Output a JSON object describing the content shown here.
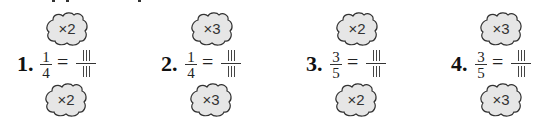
{
  "exercise": {
    "problems": [
      {
        "number": "1.",
        "numerator": "1",
        "denominator": "4",
        "equals": "=",
        "top_multiplier": "×2",
        "bottom_multiplier": "×2",
        "answer_numerator": "",
        "answer_denominator": ""
      },
      {
        "number": "2.",
        "numerator": "1",
        "denominator": "4",
        "equals": "=",
        "top_multiplier": "×3",
        "bottom_multiplier": "×3",
        "answer_numerator": "",
        "answer_denominator": ""
      },
      {
        "number": "3.",
        "numerator": "3",
        "denominator": "5",
        "equals": "=",
        "top_multiplier": "×2",
        "bottom_multiplier": "×2",
        "answer_numerator": "",
        "answer_denominator": ""
      },
      {
        "number": "4.",
        "numerator": "3",
        "denominator": "5",
        "equals": "=",
        "top_multiplier": "×3",
        "bottom_multiplier": "×3",
        "answer_numerator": "",
        "answer_denominator": ""
      }
    ],
    "colors": {
      "cloud_fill": "#e6e6e6",
      "cloud_stroke": "#333333",
      "text": "#111111"
    }
  }
}
